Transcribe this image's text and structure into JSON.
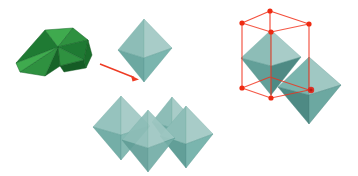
{
  "figure": {
    "title": "Octahedron net folding into octahedron and octahedral packing in a cube",
    "background_color": "#ffffff",
    "width": 358,
    "height": 176
  },
  "panels": [
    {
      "id": "green-net",
      "label": "folded-polyhedral-net",
      "description": "Green folded net of triangular faces, partially assembled octahedron",
      "palette": {
        "light": "#3faa4e",
        "mid": "#2f9140",
        "dark": "#1f7a33",
        "darkest": "#176428",
        "edge": "#12591f"
      }
    },
    {
      "id": "transform-arrow",
      "label": "fold-arrow",
      "description": "Red arrow indicating the folding transformation",
      "color": "#ee3b24",
      "from": [
        100,
        64
      ],
      "to": [
        138,
        79
      ]
    },
    {
      "id": "single-octahedron",
      "label": "regular-octahedron",
      "description": "Single teal regular octahedron resulting from the fold",
      "palette": {
        "light": "#a8ccc8",
        "mid": "#8dbdb7",
        "dark": "#6ca8a1",
        "darkest": "#55948d"
      }
    },
    {
      "id": "octahedron-cluster",
      "label": "octahedra-cluster",
      "description": "Cluster of four octahedra stacked in a rhombic arrangement",
      "count": 4,
      "palette": {
        "light": "#a8ccc8",
        "mid": "#8dbdb7",
        "dark": "#6ca8a1",
        "darkest": "#55948d"
      }
    },
    {
      "id": "cube-lattice",
      "label": "cube-with-octahedra",
      "description": "Red wireframe cube with red vertex markers enclosing octahedra, red center marker on front octahedron face",
      "cube_color": "#f2301a",
      "vertex_color": "#ee2b12",
      "vertex_count": 8,
      "marker_color": "#e0251a",
      "palette": {
        "light": "#a8ccc8",
        "mid": "#8dbdb7",
        "dark": "#6ca8a1",
        "darkest": "#4e8a84"
      }
    }
  ]
}
